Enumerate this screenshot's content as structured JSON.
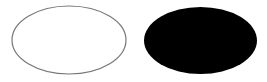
{
  "canvas": {
    "width": 267,
    "height": 82,
    "background": "#ffffff"
  },
  "shapes": [
    {
      "type": "ellipse",
      "name": "outlined-ellipse",
      "cx": 69,
      "cy": 40,
      "rx": 57,
      "ry": 34,
      "fill": "none",
      "stroke": "#777777",
      "stroke_width": 1.2
    },
    {
      "type": "ellipse",
      "name": "filled-ellipse",
      "cx": 200.5,
      "cy": 40.5,
      "rx": 56.5,
      "ry": 33.5,
      "fill": "#000000",
      "stroke": "none",
      "stroke_width": 0
    }
  ]
}
